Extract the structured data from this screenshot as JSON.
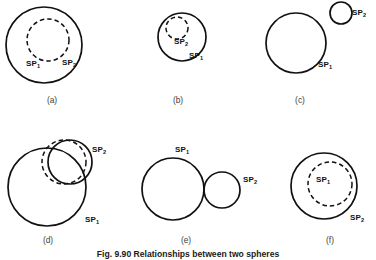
{
  "figure": {
    "caption": "Fig. 9.90 Relationships between two spheres",
    "caption_x": 188,
    "caption_y": 257,
    "colors": {
      "stroke": "#111111",
      "background": "#ffffff",
      "label_text": "#3c3c3c"
    },
    "panels": [
      {
        "id": "a",
        "label": "(a)",
        "label_x": 52,
        "label_y": 103,
        "description": "SP1 entirely inside SP2",
        "circles": [
          {
            "name": "sp2-outer-circle",
            "style": "solid",
            "cx": 44,
            "cy": 45,
            "r": 38
          },
          {
            "name": "sp1-inner-circle",
            "style": "dashed",
            "cx": 48,
            "cy": 40,
            "r": 21
          }
        ],
        "labels": [
          {
            "name": "sp1-label",
            "text": "SP",
            "sub": "1",
            "x": 26,
            "y": 66
          },
          {
            "name": "sp2-label",
            "text": "SP",
            "sub": "2",
            "x": 62,
            "y": 65
          }
        ]
      },
      {
        "id": "b",
        "label": "(b)",
        "label_x": 178,
        "label_y": 103,
        "description": "SP2 entirely inside SP1",
        "circles": [
          {
            "name": "sp1-outer-circle",
            "style": "solid",
            "cx": 182,
            "cy": 37,
            "r": 24
          },
          {
            "name": "sp2-inner-circle",
            "style": "dashed",
            "cx": 177,
            "cy": 28,
            "r": 11
          }
        ],
        "labels": [
          {
            "name": "sp2-label",
            "text": "SP",
            "sub": "2",
            "x": 174,
            "y": 44
          },
          {
            "name": "sp1-label",
            "text": "SP",
            "sub": "1",
            "x": 189,
            "y": 58
          }
        ]
      },
      {
        "id": "c",
        "label": "(c)",
        "label_x": 300,
        "label_y": 103,
        "description": "SP1 and SP2 separate, no contact",
        "circles": [
          {
            "name": "sp1-large-circle",
            "style": "solid",
            "cx": 296,
            "cy": 43,
            "r": 30
          },
          {
            "name": "sp2-small-circle",
            "style": "solid",
            "cx": 341,
            "cy": 13,
            "r": 11
          }
        ],
        "labels": [
          {
            "name": "sp2-label",
            "text": "SP",
            "sub": "2",
            "x": 352,
            "y": 15
          },
          {
            "name": "sp1-label",
            "text": "SP",
            "sub": "1",
            "x": 318,
            "y": 67
          }
        ]
      },
      {
        "id": "d",
        "label": "(d)",
        "label_x": 48,
        "label_y": 243,
        "description": "SP1 and SP2 intersecting",
        "circles": [
          {
            "name": "sp1-large-circle",
            "style": "solid",
            "cx": 47,
            "cy": 187,
            "r": 39
          },
          {
            "name": "sp2-circle-solid",
            "style": "solid",
            "cx": 70,
            "cy": 162,
            "r": 22
          },
          {
            "name": "sp2-circle-dashed",
            "style": "dashed",
            "cx": 64,
            "cy": 162,
            "r": 22
          }
        ],
        "labels": [
          {
            "name": "sp2-label",
            "text": "SP",
            "sub": "2",
            "x": 92,
            "y": 152
          },
          {
            "name": "sp1-label",
            "text": "SP",
            "sub": "1",
            "x": 85,
            "y": 222
          }
        ]
      },
      {
        "id": "e",
        "label": "(e)",
        "label_x": 186,
        "label_y": 243,
        "description": "SP1 and SP2 externally tangent",
        "circles": [
          {
            "name": "sp1-large-circle",
            "style": "solid",
            "cx": 173,
            "cy": 189,
            "r": 31
          },
          {
            "name": "sp2-small-circle",
            "style": "solid",
            "cx": 222,
            "cy": 190,
            "r": 18
          }
        ],
        "labels": [
          {
            "name": "sp1-label",
            "text": "SP",
            "sub": "1",
            "x": 175,
            "y": 152
          },
          {
            "name": "sp2-label",
            "text": "SP",
            "sub": "2",
            "x": 243,
            "y": 182
          }
        ]
      },
      {
        "id": "f",
        "label": "(f)",
        "label_x": 330,
        "label_y": 243,
        "description": "SP1 internally tangent inside SP2",
        "circles": [
          {
            "name": "sp2-outer-circle",
            "style": "solid",
            "cx": 324,
            "cy": 186,
            "r": 33
          },
          {
            "name": "sp1-inner-circle",
            "style": "dashed",
            "cx": 330,
            "cy": 184,
            "r": 22
          }
        ],
        "labels": [
          {
            "name": "sp1-label",
            "text": "SP",
            "sub": "1",
            "x": 316,
            "y": 182
          },
          {
            "name": "sp2-label",
            "text": "SP",
            "sub": "2",
            "x": 350,
            "y": 220
          }
        ]
      }
    ]
  }
}
